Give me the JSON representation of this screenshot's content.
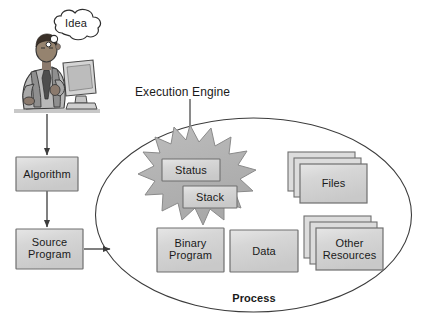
{
  "figure": {
    "type": "diagram",
    "background_color": "#ffffff"
  },
  "colors": {
    "box_fill": "#d2d2d2",
    "box_fill_light": "#e2e2e2",
    "box_border": "#7d7d7d",
    "starburst_fill": "#b2b2b2",
    "starburst_border": "#8a8a8a",
    "ellipse_border": "#3c3c3c",
    "arrow": "#3c3c3c",
    "text": "#1a1a1a",
    "person_skin": "#8f7f72",
    "person_shirt": "#b8b8b8",
    "monitor": "#cfcfcf"
  },
  "illustration": {
    "person": {
      "name": "programmer-at-computer",
      "description": "man seated at a desktop computer, typing on keyboard"
    },
    "thought_bubble": {
      "label": "Idea"
    }
  },
  "flow_boxes": [
    {
      "id": "algorithm",
      "label": "Algorithm"
    },
    {
      "id": "source-program",
      "label": "Source\nProgram"
    }
  ],
  "arrows": [
    {
      "id": "person-to-algorithm",
      "direction": "down"
    },
    {
      "id": "algorithm-to-source-program",
      "direction": "down"
    },
    {
      "id": "source-program-to-process",
      "direction": "right"
    }
  ],
  "process": {
    "label": "Process",
    "shape": "ellipse",
    "callout": {
      "label": "Execution Engine",
      "points_to": "starburst"
    },
    "starburst": {
      "id": "execution-engine",
      "inner_boxes": [
        {
          "id": "status",
          "label": "Status"
        },
        {
          "id": "stack",
          "label": "Stack"
        }
      ]
    },
    "boxes": [
      {
        "id": "binary-program",
        "label": "Binary\nProgram",
        "stacked": false
      },
      {
        "id": "data",
        "label": "Data",
        "stacked": false
      },
      {
        "id": "files",
        "label": "Files",
        "stacked": true,
        "stack_count": 3
      },
      {
        "id": "other-resources",
        "label": "Other\nResources",
        "stacked": true,
        "stack_count": 3
      }
    ]
  }
}
